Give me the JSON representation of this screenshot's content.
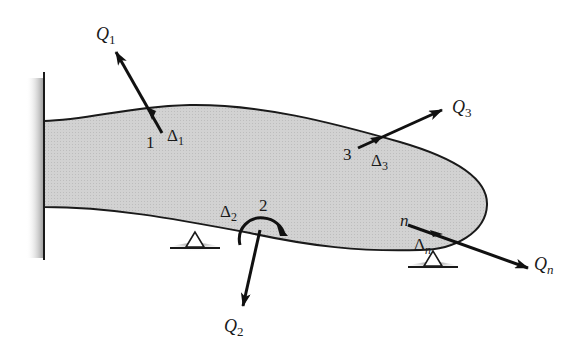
{
  "diagram": {
    "type": "structural-member-coordinates",
    "colors": {
      "body_fill": "#cfcfcf",
      "outline": "#1a1a1a",
      "arrow": "#111111",
      "wall_shadow": "#9a9a9a"
    },
    "coordinates": [
      {
        "id": "1",
        "number_label": "1",
        "force_label": "Q",
        "force_sub": "1",
        "disp_label": "Δ",
        "disp_sub": "1",
        "kind": "translation"
      },
      {
        "id": "2",
        "number_label": "2",
        "force_label": "Q",
        "force_sub": "2",
        "disp_label": "Δ",
        "disp_sub": "2",
        "kind": "rotation"
      },
      {
        "id": "3",
        "number_label": "3",
        "force_label": "Q",
        "force_sub": "3",
        "disp_label": "Δ",
        "disp_sub": "3",
        "kind": "translation"
      },
      {
        "id": "n",
        "number_label": "n",
        "force_label": "Q",
        "force_sub": "n",
        "disp_label": "Δ",
        "disp_sub": "n",
        "kind": "translation"
      }
    ],
    "supports": [
      {
        "type": "fixed-wall",
        "side": "left"
      },
      {
        "type": "roller",
        "position": "bottom-middle"
      },
      {
        "type": "roller",
        "position": "bottom-right"
      }
    ]
  }
}
